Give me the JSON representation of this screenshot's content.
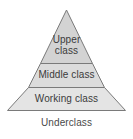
{
  "diagram": {
    "type": "pyramid",
    "name": "social-class-pyramid",
    "background_color": "#ffffff",
    "outline_color": "#7a7a7a",
    "text_color": "#3b3b3b",
    "layers": [
      {
        "id": "upper",
        "label": "Upper\nclass",
        "label_line_1": "Upper",
        "label_line_2": "class",
        "fill_color": "#d3d3d3"
      },
      {
        "id": "middle",
        "label": "Middle class",
        "fill_color": "#dcdcdc"
      },
      {
        "id": "working",
        "label": "Working class",
        "fill_color": "#e4e4e4"
      }
    ],
    "base_label": "Underclass"
  }
}
